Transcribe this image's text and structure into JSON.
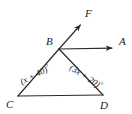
{
  "figure": {
    "background_color": "#ffffff",
    "stroke_color": "#2b2b2b",
    "text_color": "#1a1a1a",
    "points": {
      "B": {
        "label": "B",
        "x": 59,
        "y": 49,
        "label_x": 46,
        "label_y": 45
      },
      "C": {
        "label": "C",
        "x": 18,
        "y": 96,
        "label_x": 6,
        "label_y": 108
      },
      "D": {
        "label": "D",
        "x": 103,
        "y": 95,
        "label_x": 100,
        "label_y": 109
      },
      "F": {
        "label": "F",
        "x": 83,
        "y": 22,
        "label_x": 85,
        "label_y": 17
      },
      "A": {
        "label": "A",
        "x": 116,
        "y": 48,
        "label_x": 119,
        "label_y": 45
      }
    },
    "segments": [
      {
        "name": "segment-BC",
        "from": "B",
        "to": "C"
      },
      {
        "name": "segment-BD",
        "from": "B",
        "to": "D"
      },
      {
        "name": "segment-CD",
        "from": "C",
        "to": "D"
      }
    ],
    "rays": [
      {
        "name": "ray-BF",
        "from": "B",
        "to": "F",
        "arrow": true
      },
      {
        "name": "ray-BA",
        "from": "B",
        "to": "A",
        "arrow": true
      }
    ],
    "angle_labels": [
      {
        "name": "angle-label-ABD",
        "expression": "(3x + 20)",
        "degree_symbol": "°",
        "x": 69,
        "y": 69,
        "rotation": 33
      },
      {
        "name": "angle-label-BCD",
        "expression": "(x + 40)",
        "degree_symbol": "°",
        "x": 22,
        "y": 85,
        "rotation": -28
      }
    ]
  }
}
